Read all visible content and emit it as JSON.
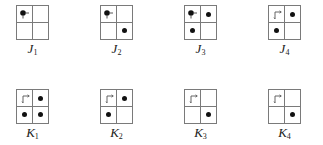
{
  "diagram": {
    "colors": {
      "grid_line": "#7a7a7a",
      "dot": "#111111",
      "label": "#222222"
    },
    "rows": [
      {
        "name": "J",
        "panels": [
          {
            "label": "J",
            "sub": "1",
            "cells": {
              "tl": "dot-with-arrow",
              "tr": "empty",
              "bl": "empty",
              "br": "empty"
            }
          },
          {
            "label": "J",
            "sub": "2",
            "cells": {
              "tl": "dot-with-arrow",
              "tr": "empty",
              "bl": "empty",
              "br": "dot"
            }
          },
          {
            "label": "J",
            "sub": "3",
            "cells": {
              "tl": "dot-with-arrow",
              "tr": "dot",
              "bl": "dot",
              "br": "empty"
            }
          },
          {
            "label": "J",
            "sub": "4",
            "cells": {
              "tl": "arrow",
              "tr": "dot",
              "bl": "dot",
              "br": "empty"
            }
          }
        ]
      },
      {
        "name": "K",
        "panels": [
          {
            "label": "K",
            "sub": "1",
            "cells": {
              "tl": "arrow",
              "tr": "dot",
              "bl": "dot",
              "br": "dot"
            }
          },
          {
            "label": "K",
            "sub": "2",
            "cells": {
              "tl": "arrow",
              "tr": "dot",
              "bl": "dot",
              "br": "empty"
            }
          },
          {
            "label": "K",
            "sub": "3",
            "cells": {
              "tl": "arrow",
              "tr": "empty",
              "bl": "empty",
              "br": "dot"
            }
          },
          {
            "label": "K",
            "sub": "4",
            "cells": {
              "tl": "arrow",
              "tr": "empty",
              "bl": "empty",
              "br": "dot"
            }
          }
        ]
      }
    ]
  }
}
